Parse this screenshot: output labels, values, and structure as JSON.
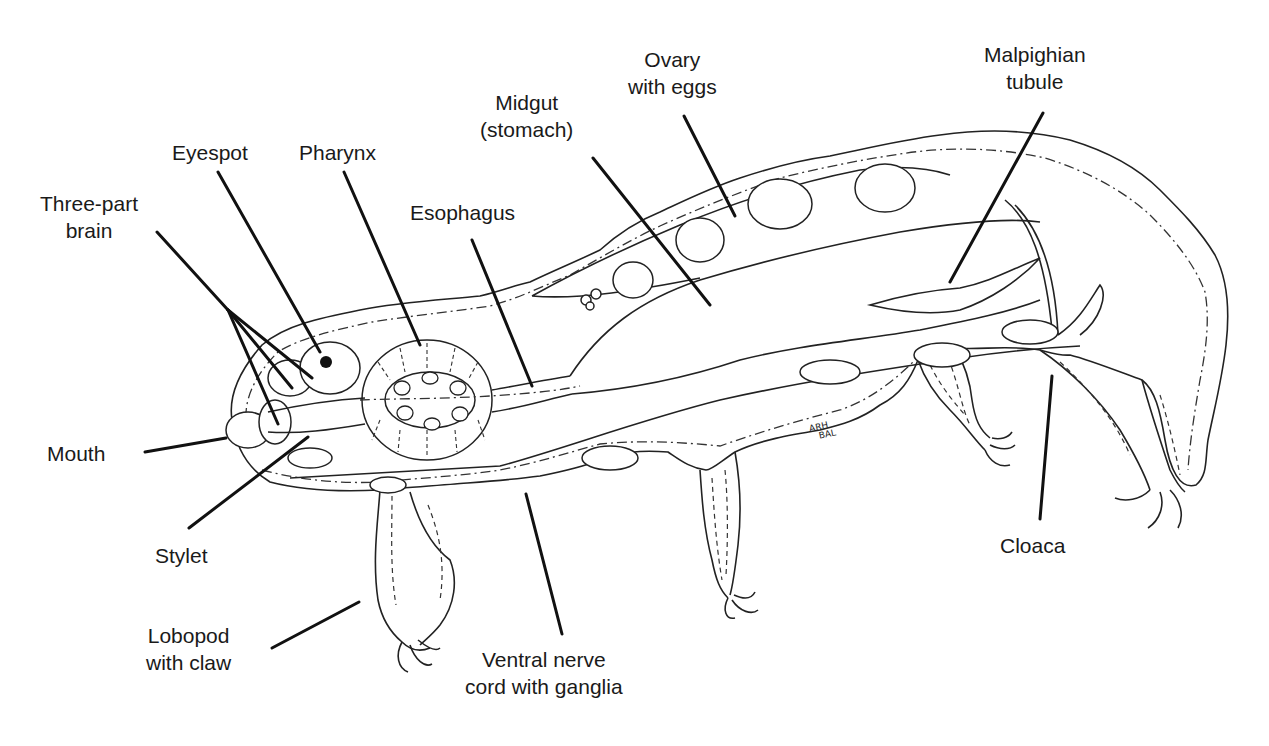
{
  "diagram": {
    "signature": [
      "ARH",
      "BAL"
    ],
    "labels": {
      "eyespot": {
        "lines": [
          "Eyespot"
        ]
      },
      "pharynx": {
        "lines": [
          "Pharynx"
        ]
      },
      "three_part_brain": {
        "lines": [
          "Three-part",
          "brain"
        ]
      },
      "esophagus": {
        "lines": [
          "Esophagus"
        ]
      },
      "midgut": {
        "lines": [
          "Midgut",
          "(stomach)"
        ]
      },
      "ovary": {
        "lines": [
          "Ovary",
          "with eggs"
        ]
      },
      "malpighian": {
        "lines": [
          "Malpighian",
          "tubule"
        ]
      },
      "mouth": {
        "lines": [
          "Mouth"
        ]
      },
      "stylet": {
        "lines": [
          "Stylet"
        ]
      },
      "lobopod": {
        "lines": [
          "Lobopod",
          "with claw"
        ]
      },
      "ventral_nerve": {
        "lines": [
          "Ventral nerve",
          "cord with ganglia"
        ]
      },
      "cloaca": {
        "lines": [
          "Cloaca"
        ]
      }
    },
    "colors": {
      "ink": "#1a1a1a",
      "background": "#ffffff"
    }
  }
}
